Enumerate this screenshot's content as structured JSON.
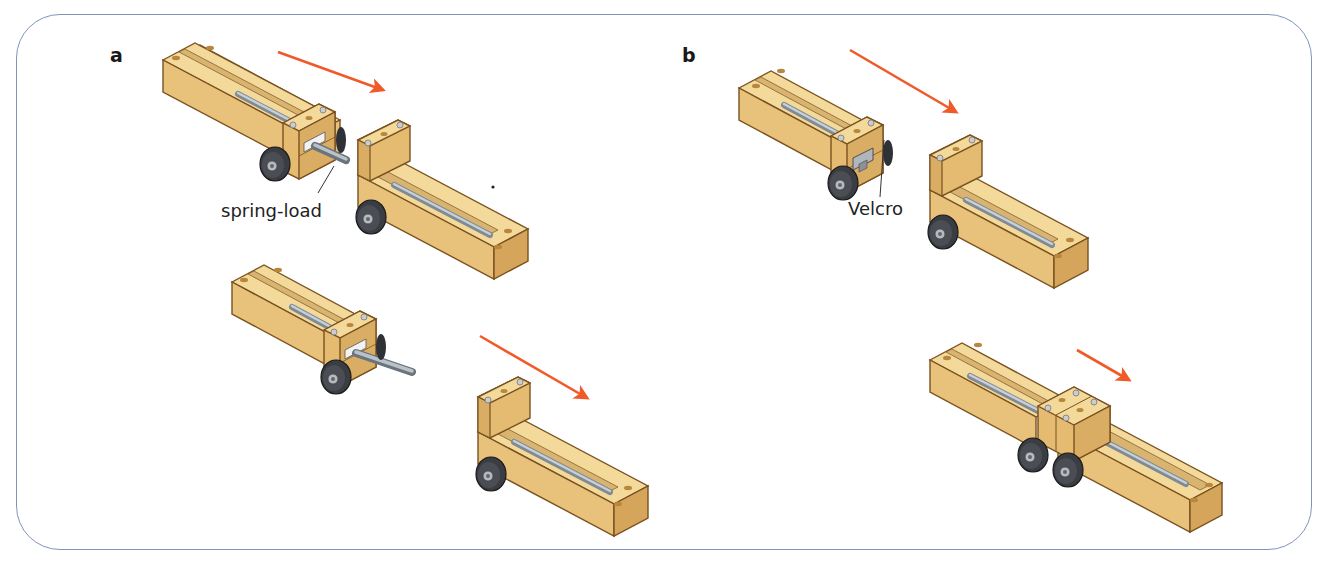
{
  "figure": {
    "panels": [
      {
        "id": "a",
        "label": "a",
        "callout": "spring-load",
        "description": "Cart with spring-loaded plunger colliding with stationary cart (elastic collision)"
      },
      {
        "id": "b",
        "label": "b",
        "callout": "Velcro",
        "description": "Cart with Velcro pad colliding and sticking to stationary cart (inelastic collision)"
      }
    ],
    "colors": {
      "arrow": "#f05a28",
      "wood_top": "#f3d99a",
      "wood_front": "#e8c27a",
      "wood_side": "#d4a55a",
      "outline": "#7a5220",
      "wheel": "#3a3d42",
      "rod": "#aab4bd",
      "frame_border": "#7f95b8"
    }
  }
}
